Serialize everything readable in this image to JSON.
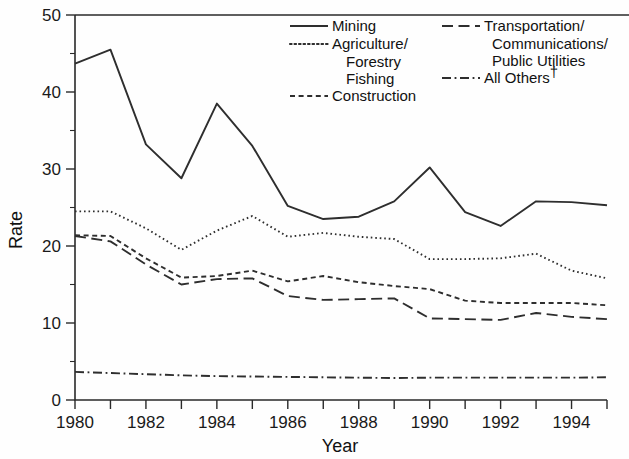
{
  "chart_data": {
    "type": "line",
    "title": "",
    "xlabel": "Year",
    "ylabel": "Rate",
    "xlim": [
      1980,
      1995
    ],
    "ylim": [
      0,
      50
    ],
    "ytick_labels": [
      "0",
      "10",
      "20",
      "30",
      "40",
      "50"
    ],
    "ytick_values": [
      0,
      10,
      20,
      30,
      40,
      50
    ],
    "yminor_values": [
      5,
      15,
      25,
      35,
      45
    ],
    "xtick_values": [
      1980,
      1981,
      1982,
      1983,
      1984,
      1985,
      1986,
      1987,
      1988,
      1989,
      1990,
      1991,
      1992,
      1993,
      1994,
      1995
    ],
    "xtick_labels": [
      "1980",
      "",
      "1982",
      "",
      "1984",
      "",
      "1986",
      "",
      "1988",
      "",
      "1990",
      "",
      "1992",
      "",
      "1994",
      ""
    ],
    "grid": false,
    "legend_position": "top-right",
    "x": [
      1980,
      1981,
      1982,
      1983,
      1984,
      1985,
      1986,
      1987,
      1988,
      1989,
      1990,
      1991,
      1992,
      1993,
      1994,
      1995
    ],
    "series": [
      {
        "name": "Mining",
        "dash": "solid",
        "values": [
          43.7,
          45.5,
          33.2,
          28.8,
          38.5,
          33.0,
          25.2,
          23.5,
          23.8,
          25.8,
          30.2,
          24.4,
          22.6,
          25.8,
          25.7,
          25.3
        ]
      },
      {
        "name": "Agriculture/ Forestry Fishing",
        "dash": "dotted",
        "values": [
          24.5,
          24.5,
          22.3,
          19.5,
          22.0,
          23.9,
          21.2,
          21.7,
          21.2,
          20.9,
          18.3,
          18.3,
          18.4,
          19.0,
          16.8,
          15.8
        ]
      },
      {
        "name": "Construction",
        "dash": "short-dash",
        "values": [
          21.4,
          21.3,
          18.4,
          15.9,
          16.1,
          16.8,
          15.4,
          16.1,
          15.3,
          14.8,
          14.4,
          12.9,
          12.6,
          12.6,
          12.6,
          12.3
        ]
      },
      {
        "name": "Transportation/ Communications/ Public Utilities",
        "dash": "long-dash",
        "values": [
          21.3,
          20.6,
          17.6,
          15.0,
          15.7,
          15.8,
          13.5,
          13.0,
          13.1,
          13.2,
          10.6,
          10.5,
          10.4,
          11.3,
          10.8,
          10.5
        ]
      },
      {
        "name": "All Others",
        "dash": "dash-dot",
        "values": [
          3.65,
          3.5,
          3.35,
          3.2,
          3.1,
          3.05,
          3.0,
          2.95,
          2.9,
          2.85,
          2.9,
          2.9,
          2.9,
          2.9,
          2.9,
          2.95
        ]
      }
    ]
  },
  "axes": {
    "y_title": "Rate",
    "x_title": "Year"
  },
  "legend": {
    "left_column": [
      {
        "label": "Mining",
        "style": "solid",
        "continuation": []
      },
      {
        "label": "Agriculture/",
        "style": "dotted",
        "continuation": [
          "Forestry",
          "Fishing"
        ]
      },
      {
        "label": "Construction",
        "style": "short-dash",
        "continuation": []
      }
    ],
    "right_column": [
      {
        "label": "Transportation/",
        "style": "long-dash",
        "continuation": [
          "Communications/",
          "Public Utilities"
        ]
      },
      {
        "label": "All Others",
        "style": "dash-dot",
        "dagger": "†",
        "continuation": []
      }
    ]
  },
  "colors": {
    "line": "#2e2e2e",
    "axis": "#2a2a2a",
    "text": "#111111",
    "background": "#fefefe"
  }
}
